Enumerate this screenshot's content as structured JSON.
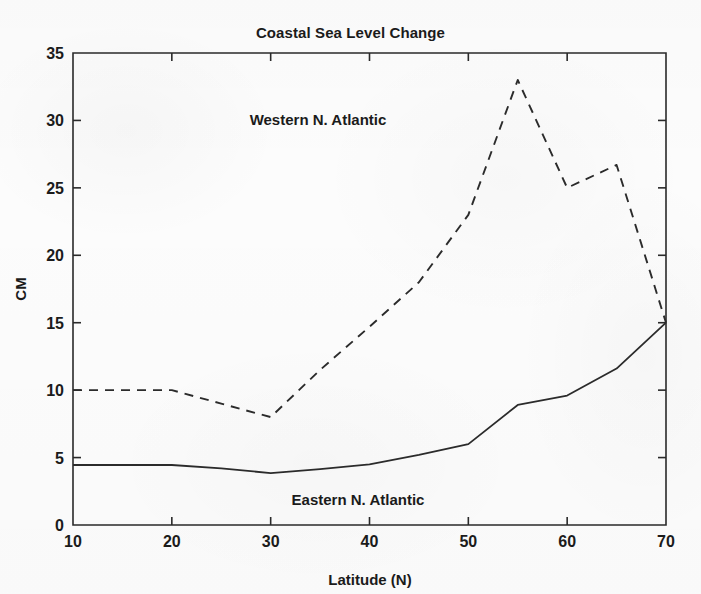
{
  "figure": {
    "title": "Coastal Sea Level Change",
    "background_color": "#fcfcfc",
    "line_color": "#2b2b2b"
  },
  "axes": {
    "x_title": "Latitude (N)",
    "y_title": "CM",
    "x_ticks": [
      "10",
      "20",
      "30",
      "40",
      "50",
      "60",
      "70"
    ],
    "y_ticks": [
      "0",
      "5",
      "10",
      "15",
      "20",
      "25",
      "30",
      "35"
    ]
  },
  "annotations": {
    "western": "Western N. Atlantic",
    "eastern": "Eastern N. Atlantic"
  },
  "chart_data": {
    "type": "line",
    "title": "Coastal Sea Level Change",
    "xlabel": "Latitude (N)",
    "ylabel": "CM",
    "xlim": [
      10,
      70
    ],
    "ylim": [
      0,
      35
    ],
    "xticks": [
      10,
      20,
      30,
      40,
      50,
      60,
      70
    ],
    "yticks": [
      0,
      5,
      10,
      15,
      20,
      25,
      30,
      35
    ],
    "grid": false,
    "legend": "in-plot text annotations",
    "x": [
      10,
      15,
      20,
      25,
      30,
      35,
      40,
      45,
      50,
      55,
      60,
      65,
      70
    ],
    "series": [
      {
        "name": "Western N. Atlantic",
        "style": "dashed",
        "values": [
          10.0,
          10.0,
          10.0,
          9.0,
          8.0,
          11.5,
          14.7,
          18.0,
          23.0,
          33.0,
          25.0,
          26.7,
          15.0
        ]
      },
      {
        "name": "Eastern N. Atlantic",
        "style": "solid",
        "values": [
          4.45,
          4.45,
          4.45,
          4.2,
          3.85,
          4.15,
          4.5,
          5.2,
          6.0,
          8.9,
          9.6,
          11.6,
          15.0
        ]
      }
    ]
  }
}
